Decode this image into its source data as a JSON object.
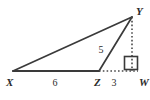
{
  "figure": {
    "type": "geometry-diagram",
    "background_color": "#ffffff",
    "line_color": "#3a3a3a",
    "label_color": "#2b2b2b",
    "vertices": [
      {
        "id": "X",
        "label": "X",
        "x": 13,
        "y": 71,
        "label_x": 6,
        "label_y": 85
      },
      {
        "id": "Z",
        "label": "Z",
        "x": 99,
        "y": 71,
        "label_x": 94,
        "label_y": 85
      },
      {
        "id": "W",
        "label": "W",
        "x": 138,
        "y": 71,
        "label_x": 139,
        "label_y": 85
      },
      {
        "id": "Y",
        "label": "Y",
        "x": 132,
        "y": 17,
        "label_x": 136,
        "label_y": 14
      }
    ],
    "segments": [
      {
        "id": "XZ",
        "from": "X",
        "to": "Z",
        "style": "solid",
        "width": 2.0
      },
      {
        "id": "XY",
        "from": "X",
        "to": "Y",
        "style": "solid",
        "width": 1.6
      },
      {
        "id": "ZY",
        "from": "Z",
        "to": "Y",
        "style": "solid",
        "width": 1.6
      },
      {
        "id": "ZW",
        "from": "Z",
        "to": "W",
        "style": "dotted",
        "width": 1.4
      },
      {
        "id": "YW",
        "from": "Y",
        "to": "W",
        "style": "dotted",
        "width": 1.4
      }
    ],
    "measures": [
      {
        "id": "XZ-length",
        "segment": "XZ",
        "value": "6",
        "x": 55,
        "y": 85
      },
      {
        "id": "ZW-length",
        "segment": "ZW",
        "value": "3",
        "x": 113,
        "y": 85
      },
      {
        "id": "ZY-length",
        "segment": "ZY",
        "value": "5",
        "x": 101,
        "y": 50
      }
    ],
    "right_angle": {
      "id": "angle-YWZ",
      "at_vertex": "W",
      "x": 124,
      "y": 56,
      "size": 13
    }
  }
}
